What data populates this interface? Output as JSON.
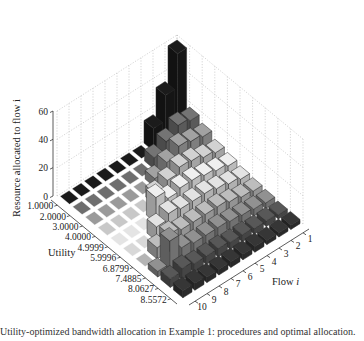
{
  "chart_data": {
    "type": "bar3d",
    "title": "",
    "xlabel": "Utility",
    "ylabel": "Flow i",
    "zlabel": "Resource allocated to flow i",
    "zlim": [
      0,
      60
    ],
    "z_ticks": [
      "0",
      "20",
      "40",
      "60"
    ],
    "utility_ticks": [
      "1.0000",
      "2.0000",
      "3.0000",
      "4.0000",
      "4.9999",
      "5.9996",
      "6.8799",
      "7.4885",
      "8.0627",
      "8.5572"
    ],
    "flow_ticks": [
      "1",
      "2",
      "3",
      "4",
      "5",
      "6",
      "7",
      "8",
      "9",
      "10"
    ],
    "grid": true,
    "values_by_utility_row": [
      [
        58,
        34,
        16,
        0,
        0,
        0,
        0,
        0,
        0,
        0
      ],
      [
        18,
        20,
        14,
        8,
        0,
        0,
        0,
        0,
        0,
        0
      ],
      [
        14,
        16,
        18,
        12,
        6,
        0,
        0,
        0,
        0,
        0
      ],
      [
        10,
        12,
        15,
        16,
        12,
        8,
        0,
        0,
        0,
        0
      ],
      [
        8,
        10,
        12,
        14,
        14,
        12,
        18,
        0,
        0,
        0
      ],
      [
        6,
        8,
        10,
        12,
        12,
        12,
        14,
        10,
        0,
        0
      ],
      [
        5,
        6,
        8,
        10,
        10,
        10,
        10,
        12,
        8,
        0
      ],
      [
        4,
        5,
        6,
        7,
        8,
        8,
        8,
        10,
        20,
        4
      ],
      [
        3,
        4,
        4,
        5,
        5,
        6,
        6,
        6,
        8,
        6
      ],
      [
        3,
        3,
        3,
        4,
        4,
        4,
        4,
        4,
        5,
        5
      ]
    ],
    "row_colors": [
      "#1a1a1a",
      "#6e6e6e",
      "#9a9a9a",
      "#c8c8c8",
      "#e4e4e4",
      "#d8d8d8",
      "#b4b4b4",
      "#8a8a8a",
      "#545454",
      "#333333"
    ]
  },
  "caption": "Utility-optimized bandwidth allocation in Example 1: procedures and optimal allocation."
}
